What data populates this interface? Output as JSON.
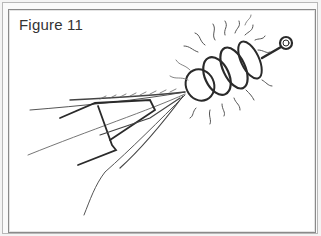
{
  "figure": {
    "caption": "Figure 11",
    "colors": {
      "border_outer": "#b8b8b8",
      "border_inner": "#8a8a8a",
      "ink": "#2a2a2a",
      "background": "#ffffff"
    }
  }
}
